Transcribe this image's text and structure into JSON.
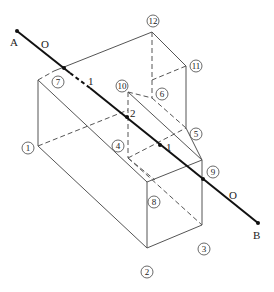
{
  "diagram": {
    "type": "descriptive-geometry-line-solid-intersection",
    "line": {
      "endpoints": [
        {
          "name": "A",
          "label": "A"
        },
        {
          "name": "B",
          "label": "B"
        }
      ],
      "segment_labels": [
        "O",
        "1",
        "2",
        "1",
        "O"
      ]
    },
    "labels": {
      "A": "A",
      "B": "B",
      "O_left": "O",
      "O_right": "O",
      "visibility_1_left": "1",
      "piercing_2": "2",
      "piercing_1": "1"
    },
    "vertices": {
      "v1": "1",
      "v2": "2",
      "v3": "3",
      "v4": "4",
      "v5": "5",
      "v6": "6",
      "v7": "7",
      "v8": "8",
      "v9": "9",
      "v10": "10",
      "v11": "11",
      "v12": "12"
    }
  }
}
